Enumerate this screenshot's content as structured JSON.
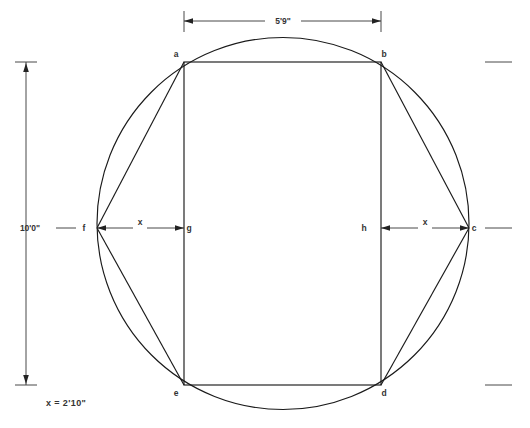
{
  "diagram": {
    "type": "geometry-construction",
    "background_color": "#ffffff",
    "line_color": "#1a1a1a",
    "text_color": "#333333",
    "canvas": {
      "width": 530,
      "height": 428
    },
    "circle": {
      "center_x": 283,
      "center_y": 223.5,
      "radius": 186,
      "label": "circumscribed-circle"
    },
    "rectangle": {
      "left": 184,
      "top": 62,
      "right": 381,
      "bottom": 385,
      "label": "inscribed-rectangle"
    },
    "points": [
      {
        "id": "a",
        "label": "a",
        "x": 184,
        "y": 62,
        "label_x": 176,
        "label_y": 57
      },
      {
        "id": "b",
        "label": "b",
        "x": 381,
        "y": 62,
        "label_x": 384,
        "label_y": 57
      },
      {
        "id": "c",
        "label": "c",
        "x": 469,
        "y": 228,
        "label_x": 474,
        "label_y": 231
      },
      {
        "id": "d",
        "label": "d",
        "x": 381,
        "y": 385,
        "label_x": 384,
        "label_y": 396
      },
      {
        "id": "e",
        "label": "e",
        "x": 184,
        "y": 385,
        "label_x": 176,
        "label_y": 396
      },
      {
        "id": "f",
        "label": "f",
        "x": 97,
        "y": 228,
        "label_x": 84,
        "label_y": 231
      },
      {
        "id": "g",
        "label": "g",
        "x": 184,
        "y": 228,
        "label_x": 189,
        "label_y": 231
      },
      {
        "id": "h",
        "label": "h",
        "x": 381,
        "y": 228,
        "label_x": 364,
        "label_y": 231
      }
    ],
    "chords": [
      {
        "name": "chord-f-a",
        "from": "f",
        "to": "a"
      },
      {
        "name": "chord-f-e",
        "from": "f",
        "to": "e"
      },
      {
        "name": "chord-c-b",
        "from": "c",
        "to": "b"
      },
      {
        "name": "chord-c-d",
        "from": "c",
        "to": "d"
      }
    ],
    "dimensions": {
      "top": {
        "name": "width-dimension",
        "value": "5'9\"",
        "from_x": 184,
        "to_x": 381,
        "y": 21,
        "ext_top": 11,
        "ext_bottom": 32,
        "text_x": 283,
        "text_y": 24
      },
      "left": {
        "name": "height-dimension",
        "value": "10'0\"",
        "x": 26,
        "from_y": 62,
        "to_y": 385,
        "text_x": 30,
        "text_y": 231,
        "tick_half_width": 11,
        "leader_from_x": 56,
        "leader_to_x": 76
      },
      "inner_left": {
        "name": "x-dimension-left",
        "value": "x",
        "from_x": 97,
        "to_x": 184,
        "y": 228,
        "text_x": 140,
        "text_y": 225
      },
      "inner_right": {
        "name": "x-dimension-right",
        "value": "x",
        "from_x": 381,
        "to_x": 469,
        "y": 228,
        "text_x": 425,
        "text_y": 225
      }
    },
    "right_extension_ticks": [
      {
        "name": "right-tick-top",
        "x1": 485,
        "x2": 512,
        "y": 62
      },
      {
        "name": "right-tick-middle",
        "x1": 485,
        "x2": 512,
        "y": 228
      },
      {
        "name": "right-tick-bottom",
        "x1": 485,
        "x2": 512,
        "y": 385
      }
    ],
    "note": {
      "name": "x-value-note",
      "text": "x  =  2'10\"",
      "x": 46,
      "y": 406
    }
  }
}
